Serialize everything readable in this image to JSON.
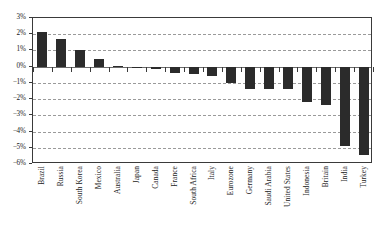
{
  "chart_data": {
    "type": "bar",
    "title": "",
    "subtitle": "",
    "xlabel": "",
    "ylabel": "",
    "ylim": [
      -6,
      3
    ],
    "ytick_labels": [
      "3%",
      "2%",
      "1%",
      "0%",
      "−1%",
      "−2%",
      "−3%",
      "−4%",
      "−5%",
      "−6%"
    ],
    "ytick_values": [
      3,
      2,
      1,
      0,
      -1,
      -2,
      -3,
      -4,
      -5,
      -6
    ],
    "grid": true,
    "grid_style": "dashed-horizontal",
    "legend": "none",
    "bar_color": "#2b2b2b",
    "categories": [
      "Brazil",
      "Russia",
      "South Korea",
      "Mexico",
      "Australia",
      "Japan",
      "Canada",
      "France",
      "South Africa",
      "Italy",
      "Eurozone",
      "Germany",
      "Saudi Arabia",
      "United States",
      "Indonesia",
      "Britain",
      "India",
      "Turkey"
    ],
    "values": [
      2.15,
      1.7,
      1.05,
      0.5,
      0.05,
      -0.05,
      -0.15,
      -0.4,
      -0.45,
      -0.55,
      -1.0,
      -1.35,
      -1.4,
      -1.4,
      -2.15,
      -2.35,
      -4.9,
      -5.45
    ]
  }
}
